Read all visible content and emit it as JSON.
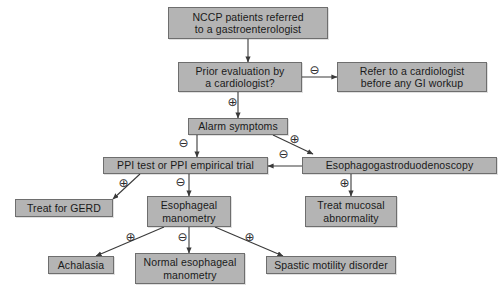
{
  "diagram": {
    "background_color": "#ffffff",
    "node_fill_color": "#b4b4b4",
    "node_border_color": "#6e6e6e",
    "connector_color": "#3a3a3a",
    "nodes": [
      {
        "id": "nccp",
        "label": "NCCP patients referred\nto a gastroenterologist",
        "x": 168,
        "y": 7,
        "w": 160,
        "h": 32
      },
      {
        "id": "prior-eval",
        "label": "Prior evaluation by\na cardiologist?",
        "x": 178,
        "y": 62,
        "w": 124,
        "h": 30
      },
      {
        "id": "refer-cardiologist",
        "label": "Refer to a cardiologist\nbefore any GI workup",
        "x": 337,
        "y": 62,
        "w": 150,
        "h": 30
      },
      {
        "id": "alarm-symptoms",
        "label": "Alarm symptoms",
        "x": 188,
        "y": 118,
        "w": 100,
        "h": 17
      },
      {
        "id": "ppi-test",
        "label": "PPI test or PPI empirical trial",
        "x": 103,
        "y": 157,
        "w": 165,
        "h": 17
      },
      {
        "id": "egd",
        "label": "Esophagogastroduodenoscopy",
        "x": 302,
        "y": 157,
        "w": 195,
        "h": 17
      },
      {
        "id": "treat-gerd",
        "label": "Treat for GERD",
        "x": 15,
        "y": 199,
        "w": 98,
        "h": 18
      },
      {
        "id": "esoph-manometry",
        "label": "Esophageal\nmanometry",
        "x": 147,
        "y": 196,
        "w": 84,
        "h": 31
      },
      {
        "id": "treat-mucosal",
        "label": "Treat mucosal\nabnormality",
        "x": 305,
        "y": 196,
        "w": 92,
        "h": 31
      },
      {
        "id": "achalasia",
        "label": "Achalasia",
        "x": 48,
        "y": 256,
        "w": 66,
        "h": 18
      },
      {
        "id": "normal-manometry",
        "label": "Normal esophageal\nmanometry",
        "x": 135,
        "y": 253,
        "w": 110,
        "h": 31
      },
      {
        "id": "spastic-disorder",
        "label": "Spastic motility disorder",
        "x": 266,
        "y": 256,
        "w": 130,
        "h": 18
      }
    ],
    "connectors": [
      {
        "id": "nccp-to-prior",
        "from": "nccp",
        "to": "prior-eval",
        "path": "M 248,39 L 248,62",
        "sign": null
      },
      {
        "id": "prior-to-refer",
        "from": "prior-eval",
        "to": "refer-cardiologist",
        "path": "M 302,77 L 337,77",
        "sign": "minus",
        "sign_x": 308,
        "sign_y": 64
      },
      {
        "id": "prior-to-alarm",
        "from": "prior-eval",
        "to": "alarm-symptoms",
        "path": "M 238,92 L 238,118",
        "sign": "plus",
        "sign_x": 226,
        "sign_y": 96
      },
      {
        "id": "alarm-to-ppi",
        "from": "alarm-symptoms",
        "to": "ppi-test",
        "path": "M 197,135 L 197,157",
        "sign": "minus",
        "sign_x": 177,
        "sign_y": 137
      },
      {
        "id": "alarm-to-egd",
        "from": "alarm-symptoms",
        "to": "egd",
        "path": "M 273,135 L 313,154",
        "sign": "plus",
        "sign_x": 288,
        "sign_y": 133
      },
      {
        "id": "egd-to-ppi",
        "from": "egd",
        "to": "ppi-test",
        "path": "M 302,166 L 268,166",
        "sign": "minus",
        "sign_x": 277,
        "sign_y": 148
      },
      {
        "id": "ppi-to-gerd",
        "from": "ppi-test",
        "to": "treat-gerd",
        "path": "M 140,174 L 113,199",
        "sign": "plus",
        "sign_x": 117,
        "sign_y": 177
      },
      {
        "id": "ppi-to-manometry",
        "from": "ppi-test",
        "to": "esoph-manometry",
        "path": "M 189,174 L 189,196",
        "sign": "minus",
        "sign_x": 174,
        "sign_y": 176
      },
      {
        "id": "egd-to-mucosal",
        "from": "egd",
        "to": "treat-mucosal",
        "path": "M 351,174 L 351,196",
        "sign": "plus",
        "sign_x": 338,
        "sign_y": 177
      },
      {
        "id": "manometry-to-achalasia",
        "from": "esoph-manometry",
        "to": "achalasia",
        "path": "M 164,227 L 96,256",
        "sign": "plus",
        "sign_x": 124,
        "sign_y": 231
      },
      {
        "id": "manometry-to-normal",
        "from": "esoph-manometry",
        "to": "normal-manometry",
        "path": "M 189,227 L 189,253",
        "sign": "minus",
        "sign_x": 176,
        "sign_y": 231
      },
      {
        "id": "manometry-to-spastic",
        "from": "esoph-manometry",
        "to": "spastic-disorder",
        "path": "M 215,227 L 283,256",
        "sign": "plus",
        "sign_x": 243,
        "sign_y": 231
      }
    ],
    "sign_glyphs": {
      "plus": "⊕",
      "minus": "⊖"
    }
  }
}
